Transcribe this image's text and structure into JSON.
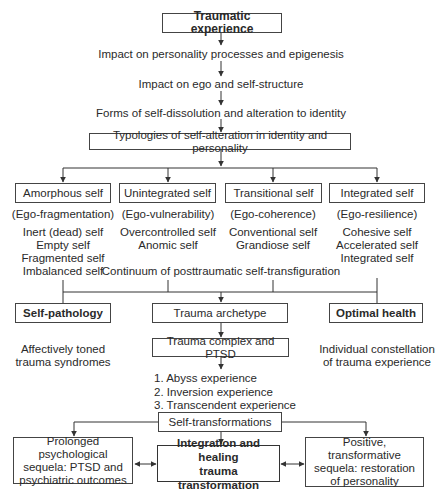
{
  "title": "Traumatic experience",
  "flow_steps": [
    "Impact on personality processes and epigenesis",
    "Impact on ego and self-structure",
    "Forms of self-dissolution and alteration to identity"
  ],
  "typologies": "Typologies of self-alteration in identity and personality",
  "types": [
    {
      "name": "Amorphous self",
      "ego": "(Ego-fragmentation)",
      "items": [
        "Inert (dead) self",
        "Empty self",
        "Fragmented self",
        "Imbalanced self"
      ]
    },
    {
      "name": "Unintegrated self",
      "ego": "(Ego-vulnerability)",
      "items": [
        "Overcontrolled self",
        "Anomic self"
      ]
    },
    {
      "name": "Transitional self",
      "ego": "(Ego-coherence)",
      "items": [
        "Conventional self",
        "Grandiose self"
      ]
    },
    {
      "name": "Integrated self",
      "ego": "(Ego-resilience)",
      "items": [
        "Cohesive self",
        "Accelerated self",
        "Integrated self"
      ]
    }
  ],
  "continuum": "Continuum of posttraumatic self-transfiguration",
  "self_pathology": {
    "label": "Self-pathology",
    "desc": [
      "Affectively toned",
      "trauma syndromes"
    ]
  },
  "trauma_archetype": "Trauma archetype",
  "optimal_health": {
    "label": "Optimal health",
    "desc": [
      "Individual constellation",
      "of trauma experience"
    ]
  },
  "trauma_complex": "Trauma complex and PTSD",
  "experiences": [
    "1. Abyss experience",
    "2. Inversion experience",
    "3. Transcendent experience"
  ],
  "self_transformations": "Self-transformations",
  "outcomes": {
    "left": [
      "Prolonged psychological",
      "sequela: PTSD and",
      "psychiatric outcomes"
    ],
    "center": [
      "Integration and healing",
      "trauma transformation"
    ],
    "right": [
      "Positive, transformative",
      "sequela: restoration",
      "of personality"
    ]
  }
}
